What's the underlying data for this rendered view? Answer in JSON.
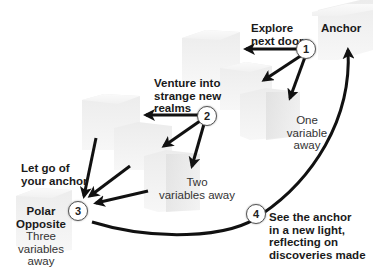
{
  "diagram": {
    "type": "stepped-cubes-flow",
    "nodes": {
      "anchor": {
        "label": "Anchor"
      },
      "one_away": {
        "label": "One variable away",
        "line1": "One",
        "line2": "variable away"
      },
      "two_away": {
        "label": "Two variables away",
        "line1": "Two",
        "line2": "variables away"
      },
      "polar": {
        "title_line1": "Polar",
        "title_line2": "Opposite",
        "sub_line1": "Three",
        "sub_line2": "variables away"
      }
    },
    "steps": [
      {
        "number": "1",
        "line1": "Explore",
        "line2": "next door"
      },
      {
        "number": "2",
        "line1": "Venture into",
        "line2": "strange new",
        "line3": "realms"
      },
      {
        "number": "3",
        "line1": "Let go of",
        "line2": "your anchor"
      },
      {
        "number": "4",
        "line1": "See the anchor",
        "line2": "in a new light,",
        "line3": "reflecting on",
        "line4": "discoveries made"
      }
    ],
    "colors": {
      "background": "#ffffff",
      "cube_top": "#f2f2f2",
      "cube_front": "#e6e6e6",
      "cube_side": "#d6d6d6",
      "arrow": "#111111",
      "text": "#1a1a1a"
    }
  }
}
